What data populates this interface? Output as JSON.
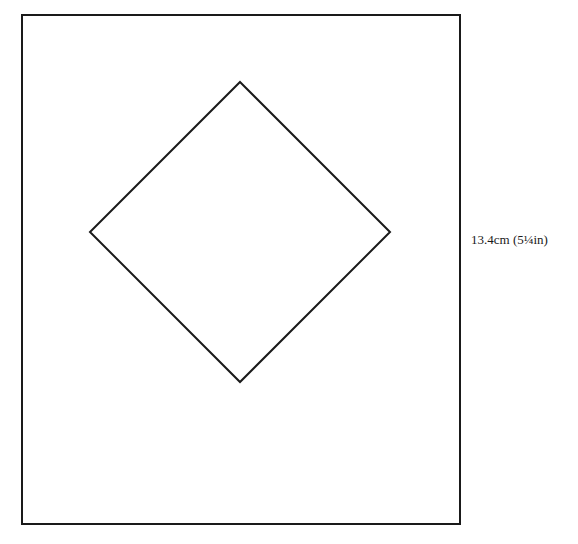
{
  "diagram": {
    "outer_square": {
      "x": 22,
      "y": 15,
      "width": 438,
      "height": 509,
      "stroke": "#1a1a1a",
      "stroke_width": 2
    },
    "inner_diamond": {
      "points": [
        [
          240,
          82
        ],
        [
          390,
          232
        ],
        [
          240,
          382
        ],
        [
          90,
          232
        ]
      ],
      "stroke": "#1a1a1a",
      "stroke_width": 2
    },
    "dimension_label": "13.4cm (5¼in)"
  }
}
